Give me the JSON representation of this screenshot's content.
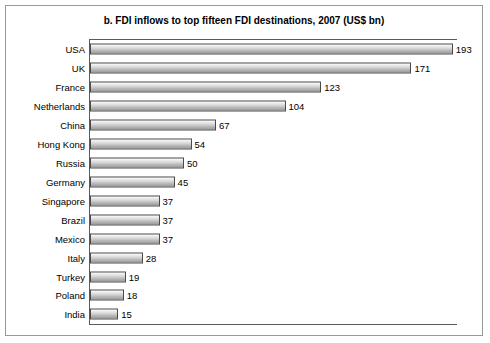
{
  "chart_data": {
    "type": "bar",
    "orientation": "horizontal",
    "title": "b. FDI inflows to top fifteen FDI destinations, 2007 (US$ bn)",
    "xlabel": "",
    "ylabel": "",
    "grid": false,
    "legend": null,
    "xlim": [
      0,
      200
    ],
    "categories": [
      "USA",
      "UK",
      "France",
      "Netherlands",
      "China",
      "Hong Kong",
      "Russia",
      "Germany",
      "Singapore",
      "Brazil",
      "Mexico",
      "Italy",
      "Turkey",
      "Poland",
      "India"
    ],
    "values": [
      193,
      171,
      123,
      104,
      67,
      54,
      50,
      45,
      37,
      37,
      37,
      28,
      19,
      18,
      15
    ],
    "value_labels": [
      "193",
      "171",
      "123",
      "104",
      "67",
      "54",
      "50",
      "45",
      "37",
      "37",
      "37",
      "28",
      "19",
      "18",
      "15"
    ]
  }
}
